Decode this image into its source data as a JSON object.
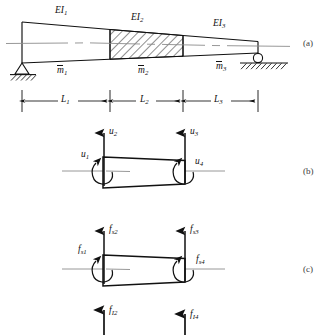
{
  "figure": {
    "panels": [
      {
        "id": "a",
        "label": "(a)"
      },
      {
        "id": "b",
        "label": "(b)"
      },
      {
        "id": "c",
        "label": "(c)"
      }
    ]
  },
  "panel_a": {
    "stiffness_labels": [
      "EI",
      "EI",
      "EI"
    ],
    "stiffness_subs": [
      "1",
      "2",
      "3"
    ],
    "mass_labels": [
      "m",
      "m",
      "m"
    ],
    "mass_subs": [
      "1",
      "2",
      "3"
    ],
    "length_labels": [
      "L",
      "L",
      "L"
    ],
    "length_subs": [
      "1",
      "2",
      "3"
    ],
    "supports": {
      "left": "pin-support",
      "right": "roller-support"
    },
    "middle_segment_fill": "diagonal-hatch"
  },
  "panel_b": {
    "caption": "nodal displacements",
    "dof_labels": [
      "u",
      "u",
      "u",
      "u"
    ],
    "dof_subs": [
      "1",
      "2",
      "3",
      "4"
    ],
    "dof_kinds": [
      "rotation",
      "translation",
      "translation",
      "rotation"
    ]
  },
  "panel_c": {
    "caption": "elastic and inertia forces",
    "elastic_symbol": "f",
    "elastic_sub_prefix": "s",
    "elastic_subs": [
      "s1",
      "s2",
      "s3",
      "s4"
    ],
    "inertia_symbol": "f",
    "inertia_subs": [
      "I2",
      "I4"
    ]
  },
  "colors": {
    "line": "#111111",
    "axis": "#8c8c8c",
    "hatch": "#222222",
    "panel_label": "#3a3a3a",
    "background": "#ffffff"
  }
}
